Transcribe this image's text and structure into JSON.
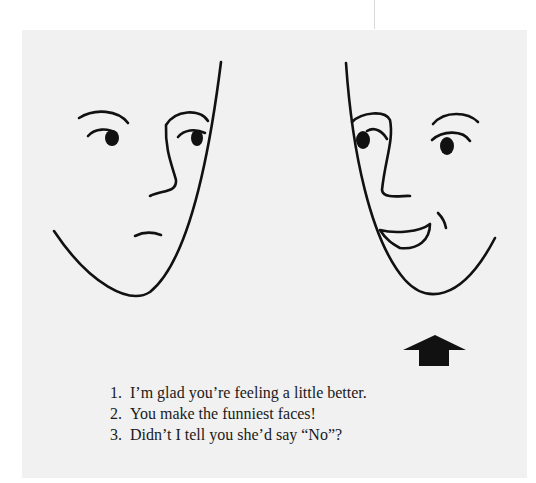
{
  "illustration": {
    "left_face": {
      "expression": "neutral",
      "label": "left-face"
    },
    "right_face": {
      "expression": "smiling",
      "label": "right-face"
    },
    "pointer": {
      "icon": "up-arrow-icon",
      "points_to": "right-face"
    }
  },
  "captions": [
    {
      "number": "1.",
      "text": "I’m glad you’re feeling a little better."
    },
    {
      "number": "2.",
      "text": "You make the funniest faces!"
    },
    {
      "number": "3.",
      "text": "Didn’t I tell you she’d say “No”?"
    }
  ],
  "colors": {
    "panel": "#f1f1f1",
    "ink": "#111111"
  }
}
